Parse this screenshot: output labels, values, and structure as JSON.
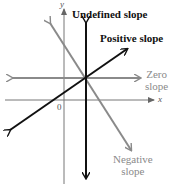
{
  "diagram": {
    "axes": {
      "x_label": "x",
      "y_label": "y",
      "origin_label": "0"
    },
    "lines": [
      {
        "name": "undefined-slope",
        "label": "Undefined slope",
        "color": "#111111"
      },
      {
        "name": "positive-slope",
        "label": "Positive slope",
        "color": "#111111"
      },
      {
        "name": "zero-slope",
        "label_line1": "Zero",
        "label_line2": "slope",
        "color": "#8a8a8a"
      },
      {
        "name": "negative-slope",
        "label_line1": "Negative",
        "label_line2": "slope",
        "color": "#8a8a8a"
      }
    ],
    "colors": {
      "dark": "#111111",
      "gray": "#8a8a8a",
      "axis": "#777777"
    }
  }
}
